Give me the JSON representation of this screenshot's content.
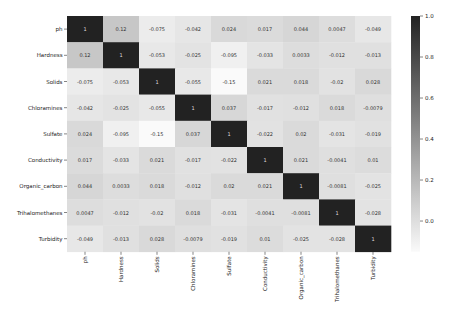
{
  "chart_data": {
    "type": "heatmap",
    "title": "",
    "xlabel": "",
    "ylabel": "",
    "labels": [
      "ph",
      "Hardness",
      "Solids",
      "Chloramines",
      "Sulfate",
      "Conductivity",
      "Organic_carbon",
      "Trihalomethanes",
      "Turbidity"
    ],
    "matrix": [
      [
        "1",
        "0.12",
        "-0.075",
        "-0.042",
        "0.024",
        "0.017",
        "0.044",
        "0.0047",
        "-0.049"
      ],
      [
        "0.12",
        "1",
        "-0.053",
        "-0.025",
        "-0.095",
        "-0.033",
        "0.0033",
        "-0.012",
        "-0.013"
      ],
      [
        "-0.075",
        "-0.053",
        "1",
        "-0.055",
        "-0.15",
        "0.021",
        "0.018",
        "-0.02",
        "0.028"
      ],
      [
        "-0.042",
        "-0.025",
        "-0.055",
        "1",
        "0.037",
        "-0.017",
        "-0.012",
        "0.018",
        "-0.0079"
      ],
      [
        "0.024",
        "-0.095",
        "-0.15",
        "0.037",
        "1",
        "-0.022",
        "0.02",
        "-0.031",
        "-0.019"
      ],
      [
        "0.017",
        "-0.033",
        "0.021",
        "-0.017",
        "-0.022",
        "1",
        "0.021",
        "-0.0041",
        "0.01"
      ],
      [
        "0.044",
        "0.0033",
        "0.018",
        "-0.012",
        "0.02",
        "0.021",
        "1",
        "-0.0081",
        "-0.025"
      ],
      [
        "0.0047",
        "-0.012",
        "-0.02",
        "0.018",
        "-0.031",
        "-0.0041",
        "-0.0081",
        "1",
        "-0.028"
      ],
      [
        "-0.049",
        "-0.013",
        "0.028",
        "-0.0079",
        "-0.019",
        "0.01",
        "-0.025",
        "-0.028",
        "1"
      ]
    ],
    "colorbar": {
      "ticks": [
        "1.0",
        "0.8",
        "0.6",
        "0.4",
        "0.2",
        "0.0"
      ],
      "range": [
        -0.15,
        1.0
      ],
      "colormap": "Greys"
    },
    "colors": {
      "low": "#ffffff",
      "high": "#222222",
      "text_dark": "#333333",
      "text_light": "#dddddd"
    }
  }
}
